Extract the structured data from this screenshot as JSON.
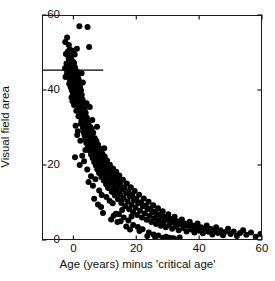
{
  "chart_data": {
    "type": "scatter",
    "title": "",
    "xlabel": "Age (years) minus 'critical age'",
    "ylabel": "Visual field area",
    "xlim": [
      -10,
      60
    ],
    "ylim": [
      0,
      60
    ],
    "xticks": [
      0,
      20,
      40,
      60
    ],
    "yticks": [
      0,
      20,
      40,
      60
    ],
    "xtick_labels": [
      "0",
      "20",
      "40",
      "60"
    ],
    "ytick_labels": [
      "0",
      "20",
      "40",
      "60"
    ],
    "grid": false,
    "legend": null,
    "marker": "filled-circle",
    "marker_color": "#000000",
    "marker_size": 3.0,
    "annotations": [
      {
        "type": "hline-segment",
        "name": "critical-area-reference-line",
        "y": 45.3,
        "x_start": -10,
        "x_end": 9.5,
        "color": "#000000"
      }
    ],
    "points": [
      [
        -2.6,
        52.8
      ],
      [
        -2.4,
        49.6
      ],
      [
        -2.2,
        47.1
      ],
      [
        -2.0,
        54.0
      ],
      [
        -1.9,
        45.2
      ],
      [
        -1.8,
        50.3
      ],
      [
        -1.7,
        43.8
      ],
      [
        -1.6,
        46.9
      ],
      [
        -1.5,
        48.4
      ],
      [
        -1.4,
        44.1
      ],
      [
        -1.35,
        41.7
      ],
      [
        -1.3,
        47.6
      ],
      [
        -1.25,
        45.9
      ],
      [
        -1.2,
        43.2
      ],
      [
        -1.15,
        50.8
      ],
      [
        -1.1,
        46.2
      ],
      [
        -1.05,
        42.5
      ],
      [
        -1.0,
        48.9
      ],
      [
        -0.95,
        44.7
      ],
      [
        -0.9,
        40.9
      ],
      [
        -0.88,
        46.5
      ],
      [
        -0.85,
        43.6
      ],
      [
        -0.82,
        47.8
      ],
      [
        -0.8,
        45.1
      ],
      [
        -0.78,
        41.3
      ],
      [
        -0.75,
        49.2
      ],
      [
        -0.72,
        44.4
      ],
      [
        -0.7,
        46.8
      ],
      [
        -0.68,
        42.1
      ],
      [
        -0.65,
        45.5
      ],
      [
        -0.62,
        48.1
      ],
      [
        -0.6,
        43.9
      ],
      [
        -0.58,
        40.2
      ],
      [
        -0.55,
        46.0
      ],
      [
        -0.52,
        44.8
      ],
      [
        -0.5,
        47.3
      ],
      [
        -0.48,
        42.7
      ],
      [
        -0.45,
        45.6
      ],
      [
        -0.42,
        39.8
      ],
      [
        -0.4,
        43.4
      ],
      [
        -0.38,
        46.4
      ],
      [
        -0.35,
        44.0
      ],
      [
        -0.32,
        41.5
      ],
      [
        -0.3,
        47.0
      ],
      [
        -0.28,
        45.3
      ],
      [
        -0.25,
        42.9
      ],
      [
        -0.22,
        38.6
      ],
      [
        -0.2,
        44.6
      ],
      [
        -0.18,
        46.7
      ],
      [
        -0.15,
        43.1
      ],
      [
        -0.12,
        45.8
      ],
      [
        -0.1,
        41.0
      ],
      [
        -0.08,
        47.5
      ],
      [
        -0.05,
        44.2
      ],
      [
        -0.02,
        39.4
      ],
      [
        0.0,
        45.0
      ],
      [
        0.03,
        42.3
      ],
      [
        0.06,
        46.3
      ],
      [
        0.1,
        43.7
      ],
      [
        0.13,
        40.5
      ],
      [
        0.16,
        44.9
      ],
      [
        0.2,
        47.2
      ],
      [
        0.23,
        41.8
      ],
      [
        0.26,
        38.2
      ],
      [
        0.3,
        44.3
      ],
      [
        0.33,
        45.7
      ],
      [
        0.36,
        42.0
      ],
      [
        0.4,
        43.5
      ],
      [
        0.44,
        39.1
      ],
      [
        0.48,
        46.1
      ],
      [
        0.52,
        44.5
      ],
      [
        0.56,
        40.7
      ],
      [
        0.6,
        42.6
      ],
      [
        0.64,
        45.4
      ],
      [
        0.68,
        37.9
      ],
      [
        0.72,
        43.3
      ],
      [
        0.76,
        41.2
      ],
      [
        0.8,
        44.1
      ],
      [
        0.85,
        38.8
      ],
      [
        0.9,
        42.4
      ],
      [
        0.95,
        40.1
      ],
      [
        1.0,
        43.0
      ],
      [
        1.05,
        36.5
      ],
      [
        1.1,
        41.6
      ],
      [
        1.15,
        44.8
      ],
      [
        1.2,
        39.0
      ],
      [
        1.25,
        42.2
      ],
      [
        1.3,
        37.3
      ],
      [
        1.35,
        40.4
      ],
      [
        1.4,
        43.8
      ],
      [
        1.45,
        38.1
      ],
      [
        1.5,
        41.1
      ],
      [
        1.55,
        35.9
      ],
      [
        1.6,
        39.6
      ],
      [
        1.65,
        42.8
      ],
      [
        1.7,
        36.8
      ],
      [
        1.75,
        40.0
      ],
      [
        1.8,
        34.7
      ],
      [
        1.85,
        38.5
      ],
      [
        1.9,
        41.4
      ],
      [
        1.95,
        37.0
      ],
      [
        2.0,
        39.3
      ],
      [
        2.05,
        33.8
      ],
      [
        2.1,
        36.2
      ],
      [
        2.15,
        40.6
      ],
      [
        2.2,
        35.1
      ],
      [
        2.25,
        38.0
      ],
      [
        2.3,
        32.9
      ],
      [
        2.35,
        36.9
      ],
      [
        2.4,
        39.9
      ],
      [
        2.45,
        34.2
      ],
      [
        2.5,
        37.6
      ],
      [
        2.55,
        31.8
      ],
      [
        2.6,
        35.4
      ],
      [
        2.65,
        38.7
      ],
      [
        2.7,
        33.3
      ],
      [
        2.75,
        36.1
      ],
      [
        2.8,
        30.9
      ],
      [
        2.85,
        34.6
      ],
      [
        2.9,
        37.4
      ],
      [
        2.95,
        32.1
      ],
      [
        3.0,
        35.8
      ],
      [
        3.05,
        29.8
      ],
      [
        3.1,
        33.5
      ],
      [
        3.15,
        36.6
      ],
      [
        3.2,
        31.2
      ],
      [
        3.25,
        34.9
      ],
      [
        3.3,
        28.7
      ],
      [
        3.35,
        32.4
      ],
      [
        3.4,
        35.2
      ],
      [
        3.45,
        30.3
      ],
      [
        3.5,
        33.7
      ],
      [
        3.55,
        27.9
      ],
      [
        3.6,
        31.5
      ],
      [
        3.65,
        34.4
      ],
      [
        3.7,
        29.2
      ],
      [
        3.75,
        32.8
      ],
      [
        3.8,
        26.8
      ],
      [
        3.85,
        30.6
      ],
      [
        3.9,
        33.9
      ],
      [
        3.95,
        28.3
      ],
      [
        4.0,
        31.9
      ],
      [
        4.1,
        25.9
      ],
      [
        4.2,
        29.5
      ],
      [
        4.3,
        32.6
      ],
      [
        4.4,
        27.2
      ],
      [
        4.5,
        30.8
      ],
      [
        4.6,
        24.8
      ],
      [
        4.7,
        28.9
      ],
      [
        4.8,
        31.3
      ],
      [
        4.9,
        26.3
      ],
      [
        5.0,
        29.1
      ],
      [
        5.1,
        23.9
      ],
      [
        5.2,
        27.7
      ],
      [
        5.3,
        30.2
      ],
      [
        5.4,
        25.4
      ],
      [
        5.5,
        28.4
      ],
      [
        5.6,
        22.8
      ],
      [
        5.7,
        26.6
      ],
      [
        5.8,
        29.7
      ],
      [
        5.9,
        24.3
      ],
      [
        6.0,
        27.4
      ],
      [
        6.1,
        21.9
      ],
      [
        6.2,
        25.7
      ],
      [
        6.3,
        28.6
      ],
      [
        6.4,
        23.4
      ],
      [
        6.5,
        26.1
      ],
      [
        6.6,
        20.8
      ],
      [
        6.7,
        24.7
      ],
      [
        6.8,
        27.1
      ],
      [
        6.9,
        22.3
      ],
      [
        7.0,
        25.2
      ],
      [
        7.1,
        19.9
      ],
      [
        7.2,
        23.7
      ],
      [
        7.3,
        26.4
      ],
      [
        7.4,
        21.4
      ],
      [
        7.5,
        24.1
      ],
      [
        7.6,
        18.9
      ],
      [
        7.7,
        22.7
      ],
      [
        7.8,
        25.5
      ],
      [
        7.9,
        20.4
      ],
      [
        8.0,
        23.2
      ],
      [
        8.15,
        17.9
      ],
      [
        8.3,
        21.8
      ],
      [
        8.45,
        24.4
      ],
      [
        8.6,
        19.5
      ],
      [
        8.75,
        22.1
      ],
      [
        8.9,
        16.8
      ],
      [
        9.05,
        20.7
      ],
      [
        9.2,
        23.0
      ],
      [
        9.35,
        18.4
      ],
      [
        9.5,
        21.1
      ],
      [
        9.65,
        15.9
      ],
      [
        9.8,
        19.8
      ],
      [
        9.95,
        22.3
      ],
      [
        10.1,
        17.3
      ],
      [
        10.25,
        20.0
      ],
      [
        10.4,
        14.9
      ],
      [
        10.55,
        18.7
      ],
      [
        10.7,
        21.2
      ],
      [
        10.85,
        16.2
      ],
      [
        11.0,
        19.0
      ],
      [
        11.2,
        13.9
      ],
      [
        11.4,
        17.6
      ],
      [
        11.6,
        20.1
      ],
      [
        11.8,
        15.2
      ],
      [
        12.0,
        18.0
      ],
      [
        12.2,
        12.9
      ],
      [
        12.4,
        16.5
      ],
      [
        12.6,
        19.1
      ],
      [
        12.8,
        14.2
      ],
      [
        13.0,
        17.0
      ],
      [
        13.2,
        11.9
      ],
      [
        13.4,
        15.5
      ],
      [
        13.6,
        18.2
      ],
      [
        13.8,
        13.2
      ],
      [
        14.0,
        16.0
      ],
      [
        14.2,
        10.9
      ],
      [
        14.4,
        14.5
      ],
      [
        14.6,
        17.2
      ],
      [
        14.8,
        12.2
      ],
      [
        15.0,
        15.0
      ],
      [
        15.25,
        9.9
      ],
      [
        15.5,
        13.5
      ],
      [
        15.75,
        16.1
      ],
      [
        16.0,
        11.2
      ],
      [
        16.25,
        14.0
      ],
      [
        16.5,
        9.0
      ],
      [
        16.75,
        12.5
      ],
      [
        17.0,
        15.1
      ],
      [
        17.25,
        10.3
      ],
      [
        17.5,
        13.0
      ],
      [
        17.75,
        8.2
      ],
      [
        18.0,
        11.6
      ],
      [
        18.25,
        14.1
      ],
      [
        18.5,
        9.4
      ],
      [
        18.75,
        12.0
      ],
      [
        19.0,
        7.4
      ],
      [
        19.25,
        10.7
      ],
      [
        19.5,
        13.1
      ],
      [
        19.75,
        8.6
      ],
      [
        20.0,
        11.0
      ],
      [
        20.3,
        6.7
      ],
      [
        20.6,
        9.8
      ],
      [
        20.9,
        12.1
      ],
      [
        21.2,
        7.8
      ],
      [
        21.5,
        10.1
      ],
      [
        21.8,
        6.0
      ],
      [
        22.1,
        9.0
      ],
      [
        22.4,
        11.1
      ],
      [
        22.7,
        7.1
      ],
      [
        23.0,
        9.2
      ],
      [
        23.3,
        5.4
      ],
      [
        23.6,
        8.2
      ],
      [
        23.9,
        10.2
      ],
      [
        24.2,
        6.4
      ],
      [
        24.5,
        8.4
      ],
      [
        24.8,
        4.8
      ],
      [
        25.1,
        7.4
      ],
      [
        25.4,
        9.3
      ],
      [
        25.7,
        5.8
      ],
      [
        26.0,
        7.6
      ],
      [
        26.3,
        4.3
      ],
      [
        26.6,
        6.7
      ],
      [
        26.9,
        8.5
      ],
      [
        27.2,
        5.2
      ],
      [
        27.5,
        6.9
      ],
      [
        27.8,
        3.8
      ],
      [
        28.1,
        6.0
      ],
      [
        28.4,
        7.7
      ],
      [
        28.7,
        4.6
      ],
      [
        29.0,
        6.2
      ],
      [
        29.4,
        3.4
      ],
      [
        29.8,
        5.4
      ],
      [
        30.2,
        6.9
      ],
      [
        30.6,
        4.1
      ],
      [
        31.0,
        5.6
      ],
      [
        31.4,
        3.0
      ],
      [
        31.8,
        4.8
      ],
      [
        32.2,
        6.2
      ],
      [
        32.6,
        3.6
      ],
      [
        33.0,
        5.0
      ],
      [
        33.5,
        2.6
      ],
      [
        34.0,
        4.3
      ],
      [
        34.5,
        5.5
      ],
      [
        35.0,
        3.2
      ],
      [
        35.5,
        4.4
      ],
      [
        36.0,
        2.3
      ],
      [
        36.5,
        3.8
      ],
      [
        37.0,
        4.9
      ],
      [
        37.5,
        2.8
      ],
      [
        38.0,
        3.9
      ],
      [
        38.5,
        2.0
      ],
      [
        39.0,
        3.4
      ],
      [
        39.5,
        4.4
      ],
      [
        40.0,
        2.5
      ],
      [
        40.6,
        3.4
      ],
      [
        41.2,
        1.8
      ],
      [
        41.8,
        3.0
      ],
      [
        42.4,
        3.9
      ],
      [
        43.0,
        2.2
      ],
      [
        43.6,
        3.0
      ],
      [
        44.2,
        1.5
      ],
      [
        44.8,
        2.6
      ],
      [
        45.4,
        3.4
      ],
      [
        46.0,
        1.9
      ],
      [
        46.8,
        2.6
      ],
      [
        47.6,
        1.3
      ],
      [
        48.4,
        2.2
      ],
      [
        49.2,
        3.0
      ],
      [
        50.0,
        1.6
      ],
      [
        51.0,
        2.3
      ],
      [
        52.0,
        1.1
      ],
      [
        53.0,
        1.9
      ],
      [
        54.0,
        2.6
      ],
      [
        55.0,
        1.4
      ],
      [
        56.5,
        2.0
      ],
      [
        58.0,
        0.9
      ],
      [
        59.5,
        1.6
      ],
      [
        61.0,
        2.2
      ],
      [
        62.5,
        1.2
      ],
      [
        64.0,
        1.7
      ],
      [
        65.5,
        0.8
      ],
      [
        67.0,
        1.4
      ],
      [
        68.5,
        1.9
      ],
      [
        70.0,
        1.0
      ],
      [
        72.0,
        1.5
      ],
      [
        74.0,
        0.7
      ],
      [
        76.0,
        1.2
      ],
      [
        78.0,
        1.6
      ],
      [
        80.0,
        0.9
      ],
      [
        82.5,
        1.3
      ],
      [
        85.0,
        0.6
      ],
      [
        87.5,
        1.0
      ],
      [
        90.0,
        1.4
      ],
      [
        92.5,
        0.8
      ],
      [
        95.0,
        1.1
      ],
      [
        97.5,
        0.5
      ],
      [
        100.0,
        0.9
      ],
      [
        3.2,
        30.0
      ],
      [
        5.0,
        51.5
      ],
      [
        4.5,
        56.8
      ],
      [
        1.9,
        57.0
      ],
      [
        7.5,
        30.2
      ],
      [
        9.8,
        24.5
      ],
      [
        13.5,
        7.0
      ],
      [
        14.5,
        6.9
      ],
      [
        17.5,
        5.2
      ],
      [
        21.0,
        2.4
      ],
      [
        23.5,
        1.1
      ],
      [
        26.0,
        0.8
      ],
      [
        28.5,
        0.6
      ],
      [
        31.5,
        0.5
      ],
      [
        33.8,
        0.7
      ],
      [
        -1.9,
        45.0
      ],
      [
        -2.1,
        44.2
      ],
      [
        -2.3,
        46.0
      ],
      [
        -2.5,
        43.5
      ],
      [
        -2.7,
        45.8
      ],
      [
        0.5,
        22.1
      ],
      [
        1.2,
        28.0
      ],
      [
        2.2,
        26.5
      ],
      [
        3.8,
        24.0
      ],
      [
        6.2,
        14.5
      ],
      [
        8.2,
        13.2
      ],
      [
        10.5,
        11.5
      ],
      [
        12.5,
        9.8
      ],
      [
        15.5,
        8.0
      ],
      [
        18.5,
        6.3
      ],
      [
        0.2,
        36.0
      ],
      [
        0.9,
        34.5
      ],
      [
        1.6,
        33.0
      ],
      [
        2.4,
        31.0
      ],
      [
        4.4,
        18.8
      ],
      [
        5.6,
        17.0
      ],
      [
        7.0,
        16.2
      ],
      [
        9.0,
        12.0
      ],
      [
        11.5,
        10.5
      ],
      [
        16.0,
        6.0
      ],
      [
        -0.6,
        38.0
      ],
      [
        -0.3,
        37.0
      ],
      [
        0.7,
        30.5
      ],
      [
        1.4,
        29.0
      ],
      [
        2.8,
        22.5
      ],
      [
        3.4,
        21.0
      ],
      [
        4.8,
        15.5
      ],
      [
        6.6,
        11.0
      ],
      [
        8.8,
        8.8
      ],
      [
        12.0,
        5.5
      ],
      [
        -1.45,
        52.0
      ],
      [
        -1.55,
        49.0
      ],
      [
        2.6,
        44.5
      ],
      [
        3.0,
        42.0
      ],
      [
        1.1,
        51.0
      ],
      [
        0.4,
        49.5
      ],
      [
        -0.1,
        50.5
      ],
      [
        5.2,
        35.5
      ],
      [
        4.2,
        36.5
      ],
      [
        6.0,
        32.0
      ],
      [
        10.0,
        16.5
      ],
      [
        11.0,
        14.0
      ],
      [
        13.0,
        12.5
      ],
      [
        19.0,
        4.0
      ],
      [
        20.5,
        3.5
      ],
      [
        22.0,
        2.9
      ],
      [
        24.0,
        2.0
      ],
      [
        25.5,
        1.5
      ],
      [
        27.0,
        1.2
      ],
      [
        29.5,
        0.9
      ],
      [
        30.5,
        0.6
      ],
      [
        32.0,
        0.4
      ],
      [
        2.0,
        20.0
      ],
      [
        7.8,
        9.5
      ],
      [
        9.4,
        7.2
      ],
      [
        14.0,
        4.8
      ],
      [
        16.8,
        3.6
      ],
      [
        18.0,
        2.8
      ],
      [
        12.8,
        6.5
      ],
      [
        15.0,
        5.0
      ]
    ]
  }
}
